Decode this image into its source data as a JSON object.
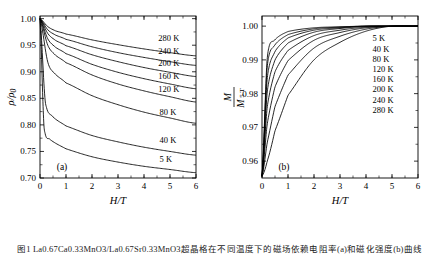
{
  "figure": {
    "caption": "图1  La0.67Ca0.33MnO3/La0.67Sr0.33MnO3超晶格在不同温度下的磁场依赖电阻率(a)和磁化强度(b)曲线"
  },
  "chart_data": [
    {
      "id": "panel-a",
      "type": "line",
      "title": "",
      "panel_label": "(a)",
      "xlabel": "H/T",
      "ylabel": "ρ/ρ0",
      "xlim": [
        0,
        6
      ],
      "ylim": [
        0.7,
        1.005
      ],
      "xticks": [
        0,
        1,
        2,
        3,
        4,
        5,
        6
      ],
      "yticks": [
        0.7,
        0.75,
        0.8,
        0.85,
        0.9,
        0.95,
        1.0
      ],
      "ytick_labels": [
        "0.70",
        "0.75",
        "0.80",
        "0.85",
        "0.90",
        "0.95",
        "1.00"
      ],
      "xtick_labels": [
        "0",
        "1",
        "2",
        "3",
        "4",
        "5",
        "6"
      ],
      "grid": false,
      "legend_position": "inline-right",
      "series": [
        {
          "name": "280 K",
          "label": "280 K",
          "y_at_H": {
            "0": 1.0,
            "0.3": 0.985,
            "0.6": 0.977,
            "1": 0.971,
            "2": 0.96,
            "3": 0.951,
            "4": 0.943,
            "5": 0.936,
            "6": 0.93
          }
        },
        {
          "name": "240 K",
          "label": "240 K",
          "y_at_H": {
            "0": 1.0,
            "0.3": 0.979,
            "0.6": 0.969,
            "1": 0.961,
            "2": 0.947,
            "3": 0.936,
            "4": 0.927,
            "5": 0.919,
            "6": 0.912
          }
        },
        {
          "name": "200 K",
          "label": "200 K",
          "y_at_H": {
            "0": 1.0,
            "0.3": 0.972,
            "0.6": 0.959,
            "1": 0.949,
            "2": 0.932,
            "3": 0.919,
            "4": 0.908,
            "5": 0.899,
            "6": 0.891
          }
        },
        {
          "name": "160 K",
          "label": "160 K",
          "y_at_H": {
            "0": 1.0,
            "0.3": 0.962,
            "0.6": 0.946,
            "1": 0.934,
            "2": 0.914,
            "3": 0.899,
            "4": 0.887,
            "5": 0.877,
            "6": 0.868
          }
        },
        {
          "name": "120 K",
          "label": "120 K",
          "y_at_H": {
            "0": 1.0,
            "0.3": 0.95,
            "0.6": 0.931,
            "1": 0.917,
            "2": 0.894,
            "3": 0.877,
            "4": 0.864,
            "5": 0.853,
            "6": 0.843
          }
        },
        {
          "name": "80 K",
          "label": "80 K",
          "y_at_H": {
            "0": 1.0,
            "0.3": 0.918,
            "0.6": 0.895,
            "1": 0.879,
            "2": 0.855,
            "3": 0.838,
            "4": 0.824,
            "5": 0.813,
            "6": 0.803
          }
        },
        {
          "name": "40 K",
          "label": "40 K",
          "y_at_H": {
            "0": 1.0,
            "0.2": 0.845,
            "0.5": 0.815,
            "1": 0.798,
            "2": 0.78,
            "3": 0.768,
            "4": 0.758,
            "5": 0.75,
            "6": 0.743
          }
        },
        {
          "name": "5 K",
          "label": "5 K",
          "y_at_H": {
            "0": 1.0,
            "0.15": 0.8,
            "0.4": 0.772,
            "1": 0.755,
            "2": 0.74,
            "3": 0.73,
            "4": 0.722,
            "5": 0.716,
            "6": 0.71
          }
        }
      ]
    },
    {
      "id": "panel-b",
      "type": "line",
      "title": "",
      "panel_label": "(b)",
      "xlabel": "H/T",
      "ylabel": "M/M 5 T",
      "ylabel_parts": {
        "numerator": "M",
        "denominator": "M",
        "sub": "5 T"
      },
      "xlim": [
        0,
        6
      ],
      "ylim": [
        0.955,
        1.003
      ],
      "xticks": [
        0,
        1,
        2,
        3,
        4,
        5,
        6
      ],
      "yticks": [
        0.96,
        0.97,
        0.98,
        0.99,
        1.0
      ],
      "ytick_labels": [
        "0.96",
        "0.97",
        "0.98",
        "0.99",
        "1.00"
      ],
      "xtick_labels": [
        "0",
        "1",
        "2",
        "3",
        "4",
        "5",
        "6"
      ],
      "grid": false,
      "legend_position": "inside-right",
      "legend_entries": [
        "5 K",
        "40 K",
        "80 K",
        "120 K",
        "160 K",
        "200 K",
        "240 K",
        "280 K"
      ],
      "series": [
        {
          "name": "5 K",
          "label": "5 K",
          "y_at_H": {
            "0": 0.9555,
            "0.2": 0.9905,
            "0.5": 0.996,
            "1": 0.9984,
            "2": 0.9995,
            "3": 0.9998,
            "4": 1.0,
            "5": 1.0,
            "6": 1.0
          }
        },
        {
          "name": "40 K",
          "label": "40 K",
          "y_at_H": {
            "0": 0.9555,
            "0.2": 0.988,
            "0.5": 0.9945,
            "1": 0.9975,
            "2": 0.9992,
            "3": 0.9997,
            "4": 1.0,
            "5": 1.0,
            "6": 1.0
          }
        },
        {
          "name": "80 K",
          "label": "80 K",
          "y_at_H": {
            "0": 0.9555,
            "0.2": 0.9845,
            "0.5": 0.9925,
            "1": 0.9965,
            "2": 0.9988,
            "3": 0.9995,
            "4": 1.0,
            "5": 1.0,
            "6": 1.0
          }
        },
        {
          "name": "120 K",
          "label": "120 K",
          "y_at_H": {
            "0": 0.9555,
            "0.2": 0.9805,
            "0.5": 0.99,
            "1": 0.995,
            "2": 0.9982,
            "3": 0.9993,
            "4": 0.9999,
            "5": 1.0,
            "6": 1.0
          }
        },
        {
          "name": "160 K",
          "label": "160 K",
          "y_at_H": {
            "0": 0.9555,
            "0.2": 0.976,
            "0.5": 0.9865,
            "1": 0.9928,
            "2": 0.9972,
            "3": 0.9988,
            "4": 0.9997,
            "5": 1.0,
            "6": 1.0
          }
        },
        {
          "name": "200 K",
          "label": "200 K",
          "y_at_H": {
            "0": 0.9555,
            "0.2": 0.971,
            "0.5": 0.982,
            "1": 0.9898,
            "2": 0.9958,
            "3": 0.9981,
            "4": 0.9995,
            "5": 1.0,
            "6": 1.0
          }
        },
        {
          "name": "240 K",
          "label": "240 K",
          "y_at_H": {
            "0": 0.9555,
            "0.2": 0.9655,
            "0.5": 0.9762,
            "1": 0.9855,
            "2": 0.9935,
            "3": 0.997,
            "4": 0.9991,
            "5": 1.0,
            "6": 1.0
          }
        },
        {
          "name": "280 K",
          "label": "280 K",
          "y_at_H": {
            "0": 0.9555,
            "0.2": 0.96,
            "0.5": 0.969,
            "1": 0.9795,
            "2": 0.99,
            "3": 0.9952,
            "4": 0.9985,
            "5": 1.0,
            "6": 1.0
          }
        }
      ]
    }
  ]
}
